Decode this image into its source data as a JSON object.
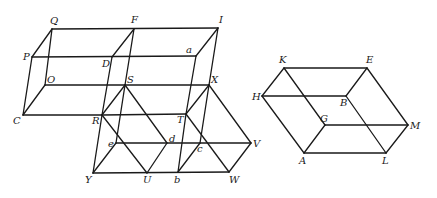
{
  "diagram": {
    "title": "",
    "left_figure": {
      "description": "Stacked/adjacent parallelepipeds with internal diagonals",
      "points": {
        "Q": [
          52,
          29
        ],
        "F": [
          134,
          29
        ],
        "I": [
          218,
          28
        ],
        "P": [
          32,
          57
        ],
        "D": [
          112,
          57
        ],
        "a": [
          196,
          56
        ],
        "O": [
          45,
          85
        ],
        "S": [
          125,
          85
        ],
        "X": [
          209,
          85
        ],
        "C": [
          23,
          115
        ],
        "R": [
          102,
          115
        ],
        "T": [
          186,
          114
        ],
        "e": [
          116,
          143
        ],
        "d": [
          167,
          143
        ],
        "c": [
          200,
          143
        ],
        "V": [
          251,
          143
        ],
        "Y": [
          93,
          173
        ],
        "U": [
          147,
          173
        ],
        "b": [
          178,
          172
        ],
        "W": [
          229,
          172
        ]
      },
      "labels": [
        {
          "text": "Q",
          "x": 50,
          "y": 24
        },
        {
          "text": "F",
          "x": 131,
          "y": 23
        },
        {
          "text": "I",
          "x": 219,
          "y": 23
        },
        {
          "text": "P",
          "x": 23,
          "y": 60
        },
        {
          "text": "D",
          "x": 102,
          "y": 67
        },
        {
          "text": "a",
          "x": 186,
          "y": 53
        },
        {
          "text": "O",
          "x": 47,
          "y": 83
        },
        {
          "text": "S",
          "x": 127,
          "y": 83
        },
        {
          "text": "X",
          "x": 211,
          "y": 83
        },
        {
          "text": "C",
          "x": 13,
          "y": 124
        },
        {
          "text": "R",
          "x": 92,
          "y": 124
        },
        {
          "text": "T",
          "x": 177,
          "y": 123
        },
        {
          "text": "e",
          "x": 108,
          "y": 147
        },
        {
          "text": "d",
          "x": 169,
          "y": 142
        },
        {
          "text": "c",
          "x": 197,
          "y": 152
        },
        {
          "text": "V",
          "x": 253,
          "y": 147
        },
        {
          "text": "Y",
          "x": 85,
          "y": 183
        },
        {
          "text": "U",
          "x": 143,
          "y": 183
        },
        {
          "text": "b",
          "x": 174,
          "y": 183
        },
        {
          "text": "W",
          "x": 229,
          "y": 183
        }
      ],
      "edges": [
        [
          "Q",
          "I"
        ],
        [
          "P",
          "a"
        ],
        [
          "O",
          "X"
        ],
        [
          "C",
          "R"
        ],
        [
          "R",
          "T"
        ],
        [
          "Q",
          "P"
        ],
        [
          "F",
          "D"
        ],
        [
          "I",
          "a"
        ],
        [
          "Q",
          "O"
        ],
        [
          "P",
          "C"
        ],
        [
          "O",
          "C"
        ],
        [
          "F",
          "S"
        ],
        [
          "D",
          "R"
        ],
        [
          "I",
          "X"
        ],
        [
          "a",
          "T"
        ],
        [
          "S",
          "R"
        ],
        [
          "X",
          "T"
        ],
        [
          "R",
          "Y"
        ],
        [
          "S",
          "e"
        ],
        [
          "T",
          "b"
        ],
        [
          "X",
          "c"
        ],
        [
          "Y",
          "W"
        ],
        [
          "e",
          "V"
        ],
        [
          "S",
          "d"
        ],
        [
          "X",
          "V"
        ],
        [
          "R",
          "U"
        ],
        [
          "T",
          "W"
        ],
        [
          "e",
          "Y"
        ],
        [
          "d",
          "U"
        ],
        [
          "c",
          "b"
        ],
        [
          "V",
          "W"
        ]
      ]
    },
    "right_figure": {
      "description": "Parallelepiped with hidden edges",
      "points": {
        "K": [
          284,
          68
        ],
        "E": [
          367,
          68
        ],
        "H": [
          262,
          96
        ],
        "B": [
          346,
          96
        ],
        "G": [
          325,
          125
        ],
        "M": [
          408,
          125
        ],
        "A": [
          304,
          153
        ],
        "L": [
          386,
          153
        ]
      },
      "labels": [
        {
          "text": "K",
          "x": 279,
          "y": 63
        },
        {
          "text": "E",
          "x": 366,
          "y": 63
        },
        {
          "text": "H",
          "x": 252,
          "y": 100
        },
        {
          "text": "B",
          "x": 340,
          "y": 106
        },
        {
          "text": "G",
          "x": 320,
          "y": 122
        },
        {
          "text": "M",
          "x": 410,
          "y": 129
        },
        {
          "text": "A",
          "x": 299,
          "y": 164
        },
        {
          "text": "L",
          "x": 382,
          "y": 164
        }
      ],
      "edges": [
        [
          "K",
          "E"
        ],
        [
          "H",
          "B"
        ],
        [
          "G",
          "M"
        ],
        [
          "A",
          "L"
        ],
        [
          "K",
          "H"
        ],
        [
          "E",
          "B"
        ],
        [
          "H",
          "A"
        ],
        [
          "B",
          "L"
        ],
        [
          "K",
          "G"
        ],
        [
          "E",
          "M"
        ],
        [
          "G",
          "A"
        ],
        [
          "M",
          "L"
        ]
      ]
    }
  }
}
